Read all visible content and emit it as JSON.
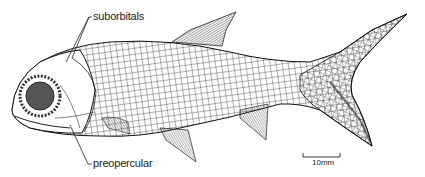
{
  "figure": {
    "labels": {
      "suborbitals": "suborbitals",
      "preopercular": "preopercular"
    },
    "scale_bar": {
      "label": "10mm"
    }
  }
}
